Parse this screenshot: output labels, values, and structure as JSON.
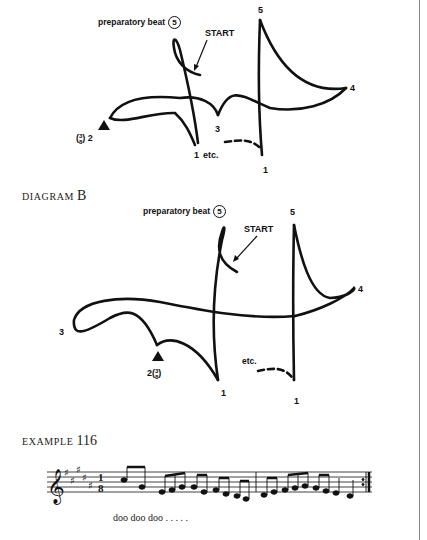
{
  "diagram_a": {
    "prep_label": "preparatory beat",
    "prep_num": "5",
    "start_label": "START",
    "beat_labels": {
      "top5": "5",
      "four": "4",
      "three": "3",
      "one_a": "1",
      "one_b": "1",
      "two": "2"
    },
    "frac_num": "3",
    "frac_den": "8",
    "etc_label": "etc."
  },
  "diagram_b": {
    "heading_small": "DIAGRAM",
    "heading_big": "B",
    "prep_label": "preparatory beat",
    "prep_num": "5",
    "start_label": "START",
    "beat_labels": {
      "top5": "5",
      "four": "4",
      "three": "3",
      "one_a": "1",
      "one_b": "1",
      "two": "2"
    },
    "frac_num": "3",
    "frac_den": "8",
    "etc_label": "etc."
  },
  "example": {
    "heading_small": "EXAMPLE",
    "heading_big": "116",
    "time_sig_top": "1",
    "time_sig_bottom": "8",
    "key_signature": "5 sharps",
    "clef": "treble",
    "lyric": "doo doo doo . . . . ."
  }
}
